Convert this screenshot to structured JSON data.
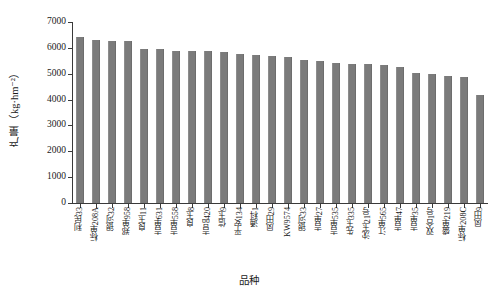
{
  "chart_data": {
    "type": "bar",
    "title": "",
    "xlabel": "品种",
    "ylabel": "产量（kg·hm⁻²）",
    "ylim": [
      0,
      7000
    ],
    "ytick_values": [
      0,
      1000,
      2000,
      3000,
      4000,
      5000,
      6000,
      7000
    ],
    "ytick_labels": [
      "0",
      "1000",
      "2000",
      "3000",
      "4000",
      "5000",
      "6000",
      "7000"
    ],
    "grid": false,
    "legend": null,
    "bar_color": "#7b7b7b",
    "categories": [
      "利民33",
      "标单208A",
      "银河32",
      "郑单958",
      "良玉11",
      "吉单631",
      "吉单558",
      "良玉8",
      "吉品420",
      "信玉9",
      "平安134",
      "通科1",
      "凤田29",
      "KW9574",
      "银河33",
      "吉单27",
      "吉单535",
      "先玉335",
      "沈玉21号",
      "江单565",
      "吉单47",
      "吉单35",
      "双合1号",
      "盛单219",
      "标单208C",
      "凤田9"
    ],
    "values": [
      6430,
      6290,
      6285,
      6280,
      5960,
      5955,
      5890,
      5870,
      5865,
      5840,
      5780,
      5735,
      5680,
      5645,
      5530,
      5480,
      5420,
      5390,
      5365,
      5320,
      5260,
      5030,
      4980,
      4930,
      4890,
      4190
    ]
  }
}
